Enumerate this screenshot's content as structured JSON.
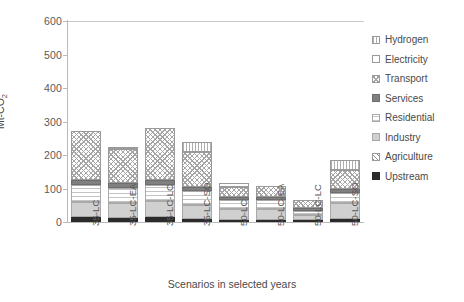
{
  "chart_data": {
    "type": "bar",
    "subtype": "stacked",
    "title": "",
    "xlabel": "Scenarios in selected  years",
    "ylabel": "Mt-CO2",
    "ylabel_html": "Mt-CO<sub>2</sub>",
    "ylim": [
      0,
      600
    ],
    "yticks": [
      0,
      100,
      200,
      300,
      400,
      500,
      600
    ],
    "grid": false,
    "legend_position": "right",
    "categories": [
      "35-LC",
      "35-LC-EA",
      "35-LC-LC",
      "35-LC-SO",
      "50-LC",
      "50-LC-EA",
      "50-LC-LC",
      "50-LC-SO"
    ],
    "series": [
      {
        "name": "Upstream",
        "pattern": "solid-black",
        "values": [
          14,
          12,
          16,
          10,
          6,
          6,
          5,
          9
        ]
      },
      {
        "name": "Agriculture",
        "pattern": "diagonal-hatch",
        "values": [
          0,
          0,
          0,
          0,
          0,
          0,
          0,
          0
        ]
      },
      {
        "name": "Industry",
        "pattern": "light-gray-solid",
        "values": [
          46,
          44,
          47,
          42,
          34,
          33,
          16,
          47
        ]
      },
      {
        "name": "Residential",
        "pattern": "horizontal-dots",
        "values": [
          50,
          46,
          47,
          40,
          26,
          26,
          12,
          30
        ]
      },
      {
        "name": "Services",
        "pattern": "dark-gray-solid",
        "values": [
          16,
          14,
          16,
          14,
          10,
          10,
          8,
          14
        ]
      },
      {
        "name": "Transport",
        "pattern": "cross-hatch",
        "values": [
          146,
          103,
          154,
          104,
          30,
          34,
          24,
          56
        ]
      },
      {
        "name": "Electricity",
        "pattern": "white-empty",
        "values": [
          0,
          6,
          0,
          0,
          12,
          0,
          0,
          0
        ]
      },
      {
        "name": "Hydrogen",
        "pattern": "vertical-lines",
        "values": [
          0,
          0,
          0,
          30,
          0,
          0,
          0,
          28
        ]
      }
    ],
    "totals": [
      272,
      225,
      280,
      240,
      118,
      109,
      65,
      184
    ]
  },
  "legend": {
    "items": [
      {
        "label": "Hydrogen",
        "swatch": "vertical-lines-swatch"
      },
      {
        "label": "Electricity",
        "swatch": "white-empty-swatch"
      },
      {
        "label": "Transport",
        "swatch": "cross-hatch-swatch"
      },
      {
        "label": "Services",
        "swatch": "dark-gray-swatch"
      },
      {
        "label": "Residential",
        "swatch": "horizontal-dots-swatch"
      },
      {
        "label": "Industry",
        "swatch": "light-gray-swatch"
      },
      {
        "label": "Agriculture",
        "swatch": "diagonal-hatch-swatch"
      },
      {
        "label": "Upstream",
        "swatch": "solid-black-swatch"
      }
    ]
  }
}
